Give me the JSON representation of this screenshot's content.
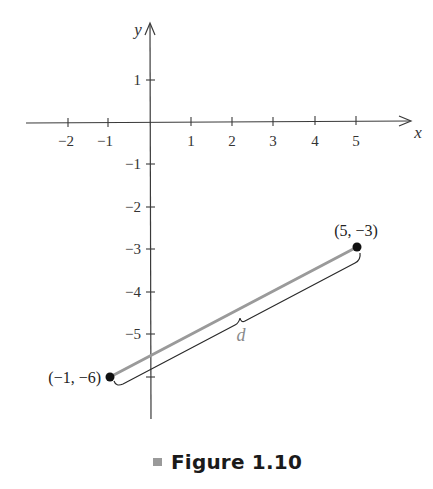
{
  "figure": {
    "caption_label": "Figure 1.10",
    "colors": {
      "axis": "#3a3a3a",
      "segment": "#9a9a9a",
      "point": "#111111",
      "brace": "#2a2a2a",
      "d_label": "#8a8a8a",
      "caption_bullet": "#9a9a9a"
    }
  },
  "axes": {
    "x_label": "x",
    "y_label": "y",
    "x_ticks": [
      {
        "value": -2,
        "label": "−2"
      },
      {
        "value": -1,
        "label": "−1"
      },
      {
        "value": 1,
        "label": "1"
      },
      {
        "value": 2,
        "label": "2"
      },
      {
        "value": 3,
        "label": "3"
      },
      {
        "value": 4,
        "label": "4"
      },
      {
        "value": 5,
        "label": "5"
      }
    ],
    "y_ticks": [
      {
        "value": 1,
        "label": "1"
      },
      {
        "value": -1,
        "label": "−1"
      },
      {
        "value": -2,
        "label": "−2"
      },
      {
        "value": -3,
        "label": "−3"
      },
      {
        "value": -4,
        "label": "−4"
      },
      {
        "value": -5,
        "label": "−5"
      },
      {
        "value": -6,
        "label": ""
      }
    ]
  },
  "points": [
    {
      "x": -1,
      "y": -6,
      "label": "(−1, −6)"
    },
    {
      "x": 5,
      "y": -3,
      "label": "(5, −3)"
    }
  ],
  "segment": {
    "label": "d"
  }
}
